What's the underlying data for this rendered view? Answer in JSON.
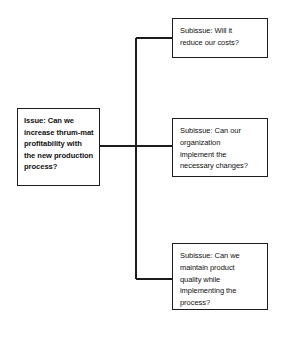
{
  "diagram": {
    "type": "issue-tree",
    "title": "",
    "root": {
      "label": "Issue: Can we\nincrease thrum-mat\nprofitability with\nthe new production\nprocess?"
    },
    "branches": [
      {
        "label": "Subissue: Will it\nreduce our costs?"
      },
      {
        "label": "Subissue: Can our\norganization\nimplement the\nnecessary changes?"
      },
      {
        "label": "Subissue: Can we\nmaintain product\nquality while\nimplementing the\nprocess?"
      }
    ],
    "style": {
      "line_color": "#1c1c1c",
      "box_fill": "#ffffff",
      "text_color": "#111111",
      "background": "#ffffff"
    }
  }
}
